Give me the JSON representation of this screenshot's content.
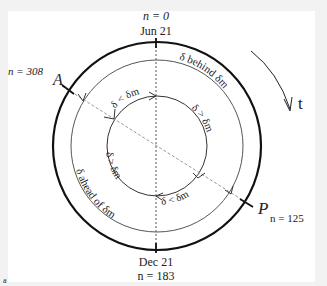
{
  "diagram": {
    "top": {
      "n_label": "n = 0",
      "date": "Jun 21"
    },
    "bottom": {
      "date": "Dec 21",
      "n_label": "n = 183"
    },
    "aphelion": {
      "letter": "A",
      "n_label": "n = 308"
    },
    "perihelion": {
      "letter": "P",
      "n_label": "n = 125"
    },
    "time_arrow": {
      "label": "t"
    },
    "middle_ring": {
      "upper_label": "δ behind δm",
      "lower_label": "δ ahead of δm"
    },
    "inner_ring": {
      "upper_left_label": "δ < δm",
      "right_label": "δ > δm",
      "left_label": "δ > δm",
      "lower_right_label": "δ < δm"
    },
    "panel_letter": "a",
    "colors": {
      "outer_ring": "#111111",
      "middle_ring": "#555555",
      "inner_ring": "#333333",
      "dashed": "#888888"
    }
  }
}
